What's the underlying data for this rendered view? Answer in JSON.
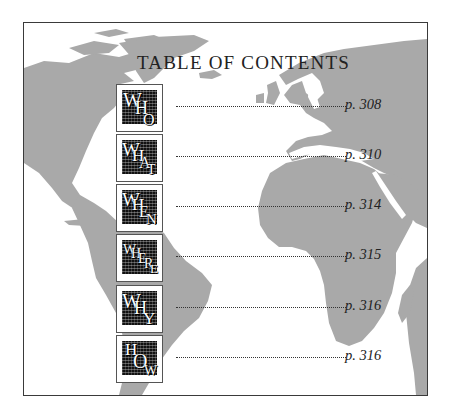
{
  "title": "TABLE OF CONTENTS",
  "colors": {
    "land": "#a9a9a9",
    "frame_border": "#3a3a3a",
    "text": "#222222",
    "icon_dark": "#111111"
  },
  "entries": [
    {
      "icon": "who-icon",
      "letters": [
        "W",
        "H",
        "O"
      ],
      "page": "p. 308"
    },
    {
      "icon": "what-icon",
      "letters": [
        "W",
        "H",
        "A",
        "T"
      ],
      "page": "p. 310"
    },
    {
      "icon": "when-icon",
      "letters": [
        "W",
        "H",
        "E",
        "N"
      ],
      "page": "p. 314"
    },
    {
      "icon": "where-icon",
      "letters": [
        "W",
        "H",
        "E",
        "R",
        "E"
      ],
      "page": "p. 315"
    },
    {
      "icon": "why-icon",
      "letters": [
        "W",
        "H",
        "Y"
      ],
      "page": "p. 316"
    },
    {
      "icon": "how-icon",
      "letters": [
        "H",
        "O",
        "W"
      ],
      "page": "p. 316"
    }
  ]
}
